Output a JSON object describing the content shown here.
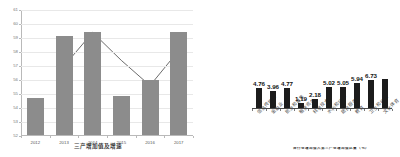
{
  "chart_data": [
    {
      "id": "tertiary-industry",
      "type": "bar",
      "title": "三产增加值及增速",
      "xlabel": "",
      "ylabel": "",
      "ylim": [
        52,
        61
      ],
      "yticks": [
        52,
        53,
        54,
        55,
        56,
        57,
        58,
        59,
        60,
        61
      ],
      "grid": true,
      "legend": "none",
      "categories": [
        "2012",
        "2013",
        "2014",
        "2015",
        "2016",
        "2017"
      ],
      "series": [
        {
          "name": "增加值",
          "kind": "bar",
          "color": "#8c8c8c",
          "values": [
            54.65,
            59.05,
            59.35,
            54.8,
            55.9,
            59.35
          ]
        },
        {
          "name": "增速",
          "kind": "line",
          "color": "#5a5a5a",
          "values": [
            null,
            57.0,
            59.4,
            57.4,
            55.6,
            58.1
          ]
        }
      ]
    },
    {
      "id": "sector-growth",
      "type": "bar",
      "title": "",
      "xlabel": "",
      "ylabel": "",
      "ylim": [
        0,
        7.4
      ],
      "grid": false,
      "legend": "none",
      "caption": "各行业增加值占第三产业增加值比重（%）",
      "categories": [
        "信息传输业",
        "金融业",
        "批发和零售",
        "租赁商务",
        "科学技术",
        "水利和环保",
        "居民服务",
        "教育",
        "卫生和社会",
        "文化体育"
      ],
      "values": [
        4.76,
        3.96,
        4.77,
        1.19,
        2.18,
        5.02,
        5.05,
        5.94,
        6.73,
        6.9
      ],
      "value_labels": [
        "4.76",
        "3.96",
        "4.77",
        "1.19",
        "2.18",
        "5.02",
        "5.05",
        "5.94",
        "6.73",
        ""
      ],
      "bar_color": "#1c1c1c"
    }
  ]
}
